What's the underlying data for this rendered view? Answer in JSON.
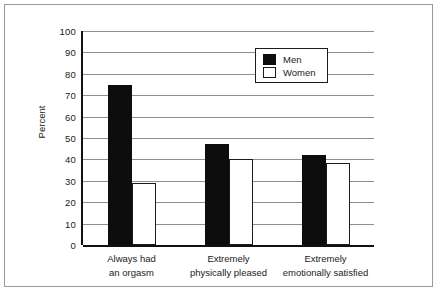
{
  "chart_data": {
    "type": "bar",
    "title": "",
    "subtitle": "",
    "xlabel": "",
    "ylabel": "Percent",
    "ylim": [
      0,
      100
    ],
    "ytick_step": 10,
    "yticks": [
      100,
      90,
      80,
      70,
      60,
      50,
      40,
      30,
      20,
      10,
      0
    ],
    "ytick_labels": [
      "100",
      "90",
      "80",
      "70",
      "60",
      "50",
      "40",
      "30",
      "20",
      "10",
      "0"
    ],
    "grid": "horizontal",
    "legend_position": "top-right-inside",
    "categories": [
      "Always had\nan orgasm",
      "Extremely\nphysically pleased",
      "Extremely\nemotionally satisfied"
    ],
    "category_lines": [
      [
        "Always had",
        "an orgasm"
      ],
      [
        "Extremely",
        "physically pleased"
      ],
      [
        "Extremely",
        "emotionally satisfied"
      ]
    ],
    "series": [
      {
        "name": "Men",
        "color": "#0d0d0d",
        "values": [
          75,
          47,
          42
        ]
      },
      {
        "name": "Women",
        "color": "#ffffff",
        "values": [
          29,
          40,
          38.5
        ]
      }
    ]
  },
  "legend": {
    "entries": [
      {
        "label": "Men",
        "style": "filled"
      },
      {
        "label": "Women",
        "style": "outlined"
      }
    ]
  },
  "axes": {
    "y_title": "Percent"
  },
  "colors": {
    "men_fill": "#0d0d0d",
    "women_fill": "#ffffff",
    "outline": "#1a1a1a",
    "gridline": "#8f8f8f",
    "frame": "#9a9a9a",
    "background": "#ffffff"
  }
}
